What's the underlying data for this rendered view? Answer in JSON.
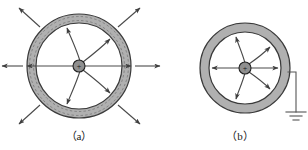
{
  "figure": {
    "background_color": "#ffffff",
    "shell_fill_color": "#b0b0b0",
    "shell_stroke_color": "#3a3a3a",
    "field_line_color": "#4a4a4a",
    "charge_fill_color": "#8f8f8f",
    "charge_stroke_color": "#222222",
    "induced_charge_dash_color": "#666666",
    "ground_wire_color": "#555555",
    "caption_color": "#1a1a1a",
    "panels": [
      {
        "id": "panel-a",
        "caption": "（a）",
        "caption_plain": "(a)",
        "center_x": 79,
        "center_y": 66,
        "outer_radius": 52,
        "inner_radius": 43,
        "charge_radius": 6,
        "charge_symbol": "+",
        "grounded": false,
        "has_external_field": true,
        "external_field_count": 8,
        "cavity_field_count": 5,
        "induced_dashed_rings": true,
        "external_arrow_inner_offset": 4,
        "external_arrow_length": 26
      },
      {
        "id": "panel-b",
        "caption": "（b）",
        "caption_plain": "(b)",
        "center_x": 245,
        "center_y": 68,
        "outer_radius": 45,
        "inner_radius": 36,
        "charge_radius": 6,
        "charge_symbol": "+",
        "grounded": true,
        "has_external_field": false,
        "external_field_count": 0,
        "cavity_field_count": 5,
        "induced_dashed_rings": false,
        "ground": {
          "wire_exit_x": 290,
          "wire_exit_y": 72,
          "wire_corner_x": 296,
          "wire_corner_y": 72,
          "wire_bottom_y": 112,
          "bar_widths": [
            20,
            12,
            6
          ],
          "bar_gap": 4,
          "label": "ground-symbol"
        }
      }
    ],
    "annotations": {
      "subject": "point-charge-inside-conducting-spherical-shell",
      "panel_a_description": "ungrounded shell with external radial field",
      "panel_b_description": "grounded shell with no external field"
    }
  }
}
